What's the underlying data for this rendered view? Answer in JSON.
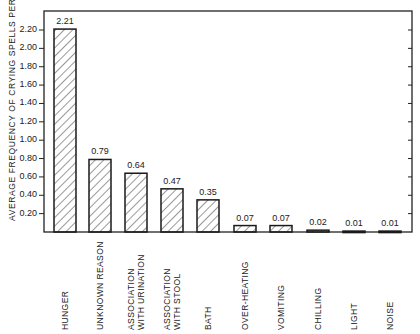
{
  "chart_data": {
    "type": "bar",
    "title": "",
    "xlabel": "",
    "ylabel": "AVERAGE FREQUENCY OF CRYING SPELLS PER DAY",
    "ylim": [
      0,
      2.3
    ],
    "yticks": [
      "0.20",
      "0.40",
      "0.60",
      "0.80",
      "1.00",
      "1.20",
      "1.40",
      "1.60",
      "1.80",
      "2.00",
      "2.20"
    ],
    "categories": [
      "HUNGER",
      "UNKNOWN REASON",
      "ASSOCIATION WITH URINATION",
      "ASSOCIATION WITH STOOL",
      "BATH",
      "OVER-HEATING",
      "VOMITING",
      "CHILLING",
      "LIGHT",
      "NOISE"
    ],
    "category_lines": [
      [
        "HUNGER"
      ],
      [
        "UNKNOWN REASON"
      ],
      [
        "ASSOCIATION",
        "WITH URINATION"
      ],
      [
        "ASSOCIATION",
        "WITH STOOL"
      ],
      [
        "BATH"
      ],
      [
        "OVER-HEATING"
      ],
      [
        "VOMITING"
      ],
      [
        "CHILLING"
      ],
      [
        "LIGHT"
      ],
      [
        "NOISE"
      ]
    ],
    "values": [
      2.21,
      0.79,
      0.64,
      0.47,
      0.35,
      0.07,
      0.07,
      0.02,
      0.01,
      0.01
    ],
    "value_labels": [
      "2.21",
      "0.79",
      "0.64",
      "0.47",
      "0.35",
      "0.07",
      "0.07",
      "0.02",
      "0.01",
      "0.01"
    ],
    "grid": false,
    "legend": null,
    "bar_pattern": "diagonal-hatch"
  }
}
